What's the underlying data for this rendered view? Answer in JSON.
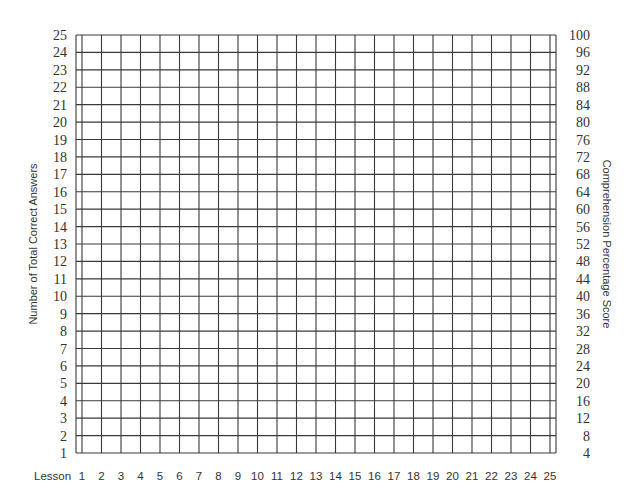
{
  "chart_data": {
    "type": "table",
    "title": "",
    "xlabel": "Lesson",
    "ylabel": "Number of Total Correct Answers",
    "ylabel_right": "Comprehension Percentage Score",
    "x_ticks": [
      1,
      2,
      3,
      4,
      5,
      6,
      7,
      8,
      9,
      10,
      11,
      12,
      13,
      14,
      15,
      16,
      17,
      18,
      19,
      20,
      21,
      22,
      23,
      24,
      25
    ],
    "y_ticks_left": [
      25,
      24,
      23,
      22,
      21,
      20,
      19,
      18,
      17,
      16,
      15,
      14,
      13,
      12,
      11,
      10,
      9,
      8,
      7,
      6,
      5,
      4,
      3,
      2,
      1
    ],
    "y_ticks_right": [
      100,
      96,
      92,
      88,
      84,
      80,
      76,
      72,
      68,
      64,
      60,
      56,
      52,
      48,
      44,
      40,
      36,
      32,
      28,
      24,
      20,
      16,
      12,
      8,
      4
    ],
    "xlim": [
      1,
      25
    ],
    "ylim": [
      1,
      25
    ],
    "ylim_right": [
      4,
      100
    ],
    "grid": true,
    "legend": null,
    "series": [],
    "colors": {
      "grid_line": "#3a3a3a",
      "text": "#333333",
      "background": "#ffffff"
    }
  }
}
